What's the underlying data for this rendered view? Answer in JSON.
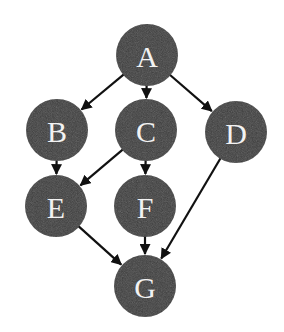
{
  "diagram": {
    "type": "directed-acyclic-graph",
    "colors": {
      "node_fill": "#3b3b3b",
      "node_label": "#f2f2f2",
      "edge": "#111111",
      "background": "#ffffff"
    },
    "nodes": [
      {
        "id": "A",
        "label": "A",
        "x": 147,
        "y": 55
      },
      {
        "id": "B",
        "label": "B",
        "x": 57,
        "y": 130
      },
      {
        "id": "C",
        "label": "C",
        "x": 146,
        "y": 130
      },
      {
        "id": "D",
        "label": "D",
        "x": 236,
        "y": 132
      },
      {
        "id": "E",
        "label": "E",
        "x": 56,
        "y": 206
      },
      {
        "id": "F",
        "label": "F",
        "x": 145,
        "y": 206
      },
      {
        "id": "G",
        "label": "G",
        "x": 145,
        "y": 286
      }
    ],
    "node_radius": 31,
    "edges": [
      {
        "from": "A",
        "to": "B"
      },
      {
        "from": "A",
        "to": "C"
      },
      {
        "from": "A",
        "to": "D"
      },
      {
        "from": "B",
        "to": "E"
      },
      {
        "from": "C",
        "to": "E"
      },
      {
        "from": "C",
        "to": "F"
      },
      {
        "from": "D",
        "to": "G"
      },
      {
        "from": "E",
        "to": "G"
      },
      {
        "from": "F",
        "to": "G"
      }
    ]
  }
}
